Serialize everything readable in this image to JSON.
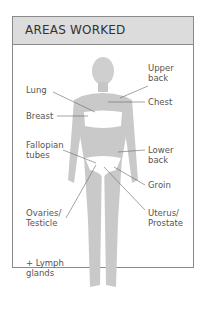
{
  "header": {
    "title": "AREAS WORKED"
  },
  "labels": {
    "upper_back": "Upper\nback",
    "lung": "Lung",
    "chest": "Chest",
    "breast": "Breast",
    "fallopian_tubes": "Fallopian\ntubes",
    "lower_back": "Lower\nback",
    "groin": "Groin",
    "ovaries_testicle": "Ovaries/\nTesticle",
    "uterus_prostate": "Uterus/\nProstate",
    "lymph_glands": "+ Lymph\nglands"
  },
  "colors": {
    "border": "#8a8a8a",
    "header_bg": "#dcdcdc",
    "body_fill": "#c8c8c8",
    "text": "#555555"
  }
}
